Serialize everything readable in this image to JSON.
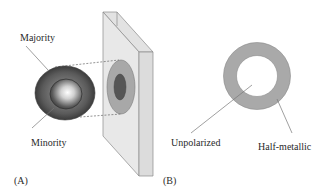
{
  "panel_a": {
    "label": "(A)",
    "majority_label": "Majority",
    "minority_label": "Minority"
  },
  "panel_b": {
    "label": "(B)",
    "unpolarized_label": "Unpolarized",
    "half_metallic_label": "Half-metallic"
  },
  "colors": {
    "sphere_outer": "#4a4a4a",
    "sphere_inner": "#6a6a6a",
    "slab_face": "#e6e6e6",
    "slab_side": "#d4d4d4",
    "projection_outer": "#a8a8a8",
    "projection_inner": "#555555",
    "ring": "#a9a9a9"
  }
}
